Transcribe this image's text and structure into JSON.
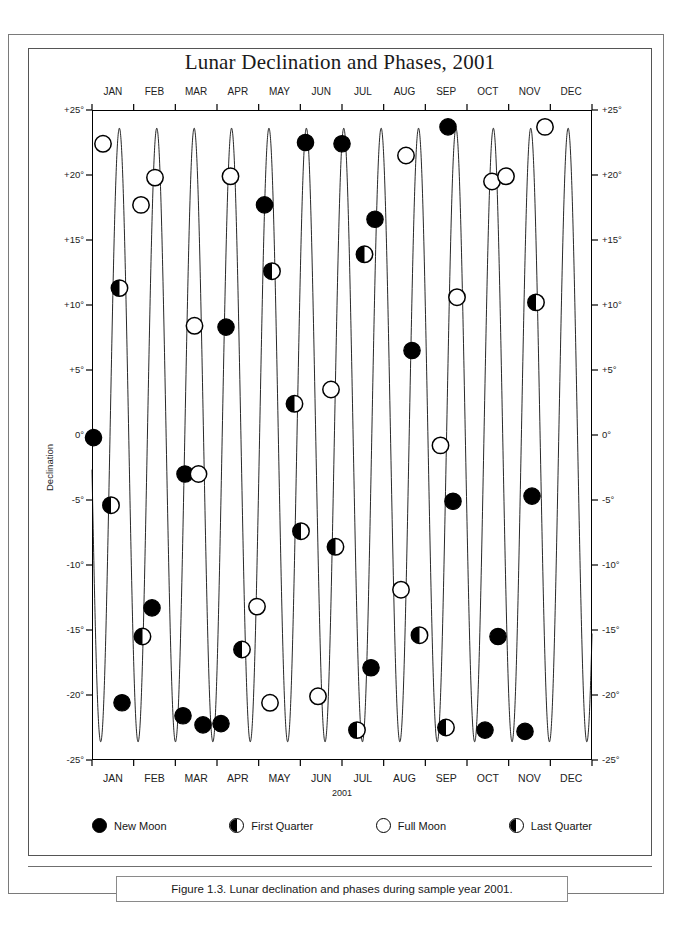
{
  "figure": {
    "title": "Lunar Declination and Phases, 2001",
    "caption": "Figure 1.3. Lunar declination and phases during sample year 2001."
  },
  "axes": {
    "y_title": "Declination",
    "x_title": "2001",
    "y_ticks_left": [
      "+25°",
      "+20°",
      "+15°",
      "+10°",
      "+5°",
      "0°",
      "-5°",
      "-10°",
      "-15°",
      "-20°",
      "-25°"
    ],
    "y_ticks_right": [
      "+25°",
      "+20°",
      "+15°",
      "+10°",
      "+5°",
      "0°",
      "-5°",
      "-10°",
      "-15°",
      "-20°",
      "-25°"
    ],
    "months": [
      "JAN",
      "FEB",
      "MAR",
      "APR",
      "MAY",
      "JUN",
      "JUL",
      "AUG",
      "SEP",
      "OCT",
      "NOV",
      "DEC"
    ]
  },
  "legend": {
    "items": [
      {
        "label": "New Moon",
        "glyph": "new-moon-icon",
        "style": "new"
      },
      {
        "label": "First Quarter",
        "glyph": "first-quarter-moon-icon",
        "style": "half-left"
      },
      {
        "label": "Full Moon",
        "glyph": "full-moon-icon",
        "style": "full"
      },
      {
        "label": "Last Quarter",
        "glyph": "last-quarter-moon-icon",
        "style": "half-left"
      }
    ]
  },
  "chart_data": {
    "type": "line",
    "title": "Lunar Declination and Phases, 2001",
    "xlabel": "2001",
    "ylabel": "Declination",
    "xlim": [
      0,
      365
    ],
    "ylim": [
      -25,
      25
    ],
    "grid": false,
    "legend_position": "below-plot",
    "x_tick_labels": [
      "JAN",
      "FEB",
      "MAR",
      "APR",
      "MAY",
      "JUN",
      "JUL",
      "AUG",
      "SEP",
      "OCT",
      "NOV",
      "DEC"
    ],
    "y_tick_values": [
      25,
      20,
      15,
      10,
      5,
      0,
      -5,
      -10,
      -15,
      -20,
      -25
    ],
    "series": [
      {
        "name": "Lunar declination",
        "description": "Sinusoidal oscillation of the Moon's declination, amplitude about 23.5 degrees, period about 27.3 days (one tropical month), 13.4 cycles across the year.",
        "amplitude_deg": 23.6,
        "period_days": 27.3,
        "phase_offset_days": 0.0,
        "cycles_per_year": 13.37
      }
    ],
    "phase_markers": [
      {
        "phase": "Full Moon",
        "month": "JAN",
        "day": 9,
        "declination": 22.4
      },
      {
        "phase": "Last Quarter",
        "month": "JAN",
        "day": 16,
        "declination": 11.3
      },
      {
        "phase": "New Moon",
        "month": "JAN",
        "day": 24,
        "declination": -0.2
      },
      {
        "phase": "First Quarter",
        "month": "JAN",
        "day": 2,
        "declination": -5.4
      },
      {
        "phase": "New Moon",
        "month": "JAN",
        "day": 24,
        "declination": -20.6
      },
      {
        "phase": "Full Moon",
        "month": "FEB",
        "day": 8,
        "declination": 17.7
      },
      {
        "phase": "Full Moon",
        "month": "FEB",
        "day": 8,
        "declination": 19.8
      },
      {
        "phase": "Last Quarter",
        "month": "FEB",
        "day": 15,
        "declination": -15.5
      },
      {
        "phase": "New Moon",
        "month": "FEB",
        "day": 23,
        "declination": -13.3
      },
      {
        "phase": "First Quarter",
        "month": "MAR",
        "day": 3,
        "declination": -3.0
      },
      {
        "phase": "Full Moon",
        "month": "MAR",
        "day": 9,
        "declination": 8.4
      },
      {
        "phase": "First Quarter",
        "month": "MAR",
        "day": 3,
        "declination": -3.0
      },
      {
        "phase": "Last Quarter",
        "month": "MAR",
        "day": 16,
        "declination": -21.6
      },
      {
        "phase": "New Moon",
        "month": "MAR",
        "day": 25,
        "declination": -22.3
      },
      {
        "phase": "First Quarter",
        "month": "APR",
        "day": 1,
        "declination": 8.3
      },
      {
        "phase": "Full Moon",
        "month": "APR",
        "day": 8,
        "declination": 19.9
      },
      {
        "phase": "Last Quarter",
        "month": "APR",
        "day": 15,
        "declination": -16.5
      },
      {
        "phase": "New Moon",
        "month": "APR",
        "day": 23,
        "declination": -22.2
      },
      {
        "phase": "New Moon",
        "month": "MAY",
        "day": 23,
        "declination": 17.7
      },
      {
        "phase": "Last Quarter",
        "month": "MAY",
        "day": 15,
        "declination": 12.6
      },
      {
        "phase": "Full Moon",
        "month": "MAY",
        "day": 7,
        "declination": -13.2
      },
      {
        "phase": "First Quarter",
        "month": "MAY",
        "day": 29,
        "declination": -20.6
      },
      {
        "phase": "New Moon",
        "month": "JUN",
        "day": 21,
        "declination": 22.5
      },
      {
        "phase": "Last Quarter",
        "month": "JUN",
        "day": 14,
        "declination": 2.4
      },
      {
        "phase": "First Quarter",
        "month": "JUN",
        "day": 28,
        "declination": -7.4
      },
      {
        "phase": "New Moon",
        "month": "JUL",
        "day": 20,
        "declination": 22.4
      },
      {
        "phase": "Last Quarter",
        "month": "JUL",
        "day": 13,
        "declination": 3.5
      },
      {
        "phase": "Full Moon",
        "month": "JUL",
        "day": 5,
        "declination": -20.1
      },
      {
        "phase": "First Quarter",
        "month": "JUL",
        "day": 27,
        "declination": -8.6
      },
      {
        "phase": "New Moon",
        "month": "AUG",
        "day": 19,
        "declination": 16.6
      },
      {
        "phase": "First Quarter",
        "month": "AUG",
        "day": 25,
        "declination": 13.9
      },
      {
        "phase": "Last Quarter",
        "month": "AUG",
        "day": 12,
        "declination": -17.9
      },
      {
        "phase": "Full Moon",
        "month": "AUG",
        "day": 4,
        "declination": -22.7
      },
      {
        "phase": "Full Moon",
        "month": "SEP",
        "day": 2,
        "declination": 21.5
      },
      {
        "phase": "New Moon",
        "month": "SEP",
        "day": 17,
        "declination": 6.5
      },
      {
        "phase": "Last Quarter",
        "month": "SEP",
        "day": 10,
        "declination": -11.9
      },
      {
        "phase": "First Quarter",
        "month": "SEP",
        "day": 24,
        "declination": -15.4
      },
      {
        "phase": "New Moon",
        "month": "OCT",
        "day": 16,
        "declination": 23.7
      },
      {
        "phase": "Full Moon",
        "month": "OCT",
        "day": 2,
        "declination": 10.6
      },
      {
        "phase": "First Quarter",
        "month": "OCT",
        "day": 24,
        "declination": -0.8
      },
      {
        "phase": "New Moon",
        "month": "OCT",
        "day": 16,
        "declination": -5.1
      },
      {
        "phase": "Last Quarter",
        "month": "OCT",
        "day": 10,
        "declination": -22.5
      },
      {
        "phase": "Full Moon",
        "month": "NOV",
        "day": 1,
        "declination": 19.5
      },
      {
        "phase": "Full Moon",
        "month": "NOV",
        "day": 30,
        "declination": 19.9
      },
      {
        "phase": "First Quarter",
        "month": "NOV",
        "day": 22,
        "declination": -15.5
      },
      {
        "phase": "New Moon",
        "month": "NOV",
        "day": 15,
        "declination": -22.7
      },
      {
        "phase": "Full Moon",
        "month": "DEC",
        "day": 30,
        "declination": 23.7
      },
      {
        "phase": "Last Quarter",
        "month": "DEC",
        "day": 7,
        "declination": 10.2
      },
      {
        "phase": "New Moon",
        "month": "DEC",
        "day": 14,
        "declination": -4.7
      },
      {
        "phase": "First Quarter",
        "month": "DEC",
        "day": 22,
        "declination": -22.8
      }
    ]
  },
  "marker_plot": [
    {
      "x": 0.022,
      "y": 22.4,
      "style": "full"
    },
    {
      "x": 0.055,
      "y": 11.3,
      "style": "half-left"
    },
    {
      "x": 0.003,
      "y": -0.2,
      "style": "new"
    },
    {
      "x": 0.038,
      "y": -5.4,
      "style": "half-left"
    },
    {
      "x": 0.06,
      "y": -20.6,
      "style": "new"
    },
    {
      "x": 0.098,
      "y": 17.7,
      "style": "full"
    },
    {
      "x": 0.126,
      "y": 19.8,
      "style": "full"
    },
    {
      "x": 0.101,
      "y": -15.5,
      "style": "half-left"
    },
    {
      "x": 0.12,
      "y": -13.3,
      "style": "new"
    },
    {
      "x": 0.186,
      "y": -3.0,
      "style": "new"
    },
    {
      "x": 0.205,
      "y": 8.4,
      "style": "full"
    },
    {
      "x": 0.213,
      "y": -3.0,
      "style": "full"
    },
    {
      "x": 0.182,
      "y": -21.6,
      "style": "new"
    },
    {
      "x": 0.222,
      "y": -22.3,
      "style": "new"
    },
    {
      "x": 0.268,
      "y": 8.3,
      "style": "new"
    },
    {
      "x": 0.277,
      "y": 19.9,
      "style": "full"
    },
    {
      "x": 0.3,
      "y": -16.5,
      "style": "half-left"
    },
    {
      "x": 0.258,
      "y": -22.2,
      "style": "new"
    },
    {
      "x": 0.345,
      "y": 17.7,
      "style": "new"
    },
    {
      "x": 0.36,
      "y": 12.6,
      "style": "half-left"
    },
    {
      "x": 0.33,
      "y": -13.2,
      "style": "full"
    },
    {
      "x": 0.356,
      "y": -20.6,
      "style": "full"
    },
    {
      "x": 0.427,
      "y": 22.5,
      "style": "new"
    },
    {
      "x": 0.405,
      "y": 2.4,
      "style": "half-left"
    },
    {
      "x": 0.418,
      "y": -7.4,
      "style": "half-left"
    },
    {
      "x": 0.5,
      "y": 22.4,
      "style": "new"
    },
    {
      "x": 0.478,
      "y": 3.5,
      "style": "full"
    },
    {
      "x": 0.452,
      "y": -20.1,
      "style": "full"
    },
    {
      "x": 0.487,
      "y": -8.6,
      "style": "half-left"
    },
    {
      "x": 0.566,
      "y": 16.6,
      "style": "new"
    },
    {
      "x": 0.545,
      "y": 13.9,
      "style": "half-left"
    },
    {
      "x": 0.558,
      "y": -17.9,
      "style": "new"
    },
    {
      "x": 0.53,
      "y": -22.7,
      "style": "half-left"
    },
    {
      "x": 0.628,
      "y": 21.5,
      "style": "full"
    },
    {
      "x": 0.64,
      "y": 6.5,
      "style": "new"
    },
    {
      "x": 0.618,
      "y": -11.9,
      "style": "full"
    },
    {
      "x": 0.655,
      "y": -15.4,
      "style": "half-left"
    },
    {
      "x": 0.712,
      "y": 23.7,
      "style": "new"
    },
    {
      "x": 0.73,
      "y": 10.6,
      "style": "full"
    },
    {
      "x": 0.697,
      "y": -0.8,
      "style": "full"
    },
    {
      "x": 0.722,
      "y": -5.1,
      "style": "new"
    },
    {
      "x": 0.708,
      "y": -22.5,
      "style": "half-left"
    },
    {
      "x": 0.8,
      "y": 19.5,
      "style": "full"
    },
    {
      "x": 0.828,
      "y": 19.9,
      "style": "full"
    },
    {
      "x": 0.812,
      "y": -15.5,
      "style": "new"
    },
    {
      "x": 0.786,
      "y": -22.7,
      "style": "new"
    },
    {
      "x": 0.906,
      "y": 23.7,
      "style": "full"
    },
    {
      "x": 0.888,
      "y": 10.2,
      "style": "half-left"
    },
    {
      "x": 0.88,
      "y": -4.7,
      "style": "new"
    },
    {
      "x": 0.866,
      "y": -22.8,
      "style": "new"
    }
  ]
}
